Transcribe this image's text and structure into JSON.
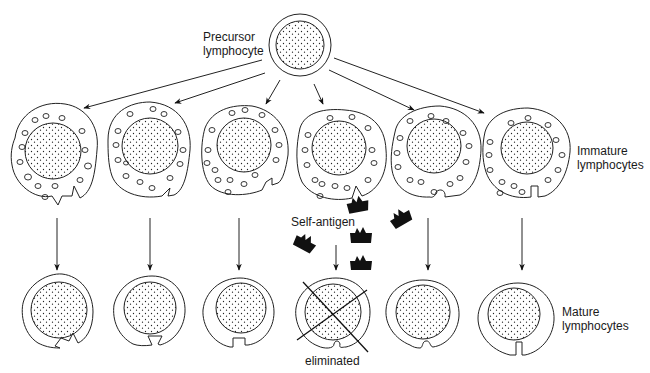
{
  "labels": {
    "precursor": [
      "Precursor",
      "lymphocyte"
    ],
    "immature": [
      "Immature",
      "lymphocytes"
    ],
    "mature": [
      "Mature",
      "lymphocytes"
    ],
    "self_antigen": "Self-antigen",
    "eliminated": "eliminated"
  },
  "precursor": {
    "cx": 300,
    "cy": 45,
    "outer_r": 31,
    "inner_r": 24
  },
  "immature_cells": [
    {
      "cx": 52,
      "cy": 157,
      "receptor": "zigzag"
    },
    {
      "cx": 147,
      "cy": 152,
      "receptor": "triangle"
    },
    {
      "cx": 244,
      "cy": 155,
      "receptor": "step"
    },
    {
      "cx": 340,
      "cy": 158,
      "receptor": "v-notch",
      "binds_self_antigen": true
    },
    {
      "cx": 437,
      "cy": 155,
      "receptor": "round"
    },
    {
      "cx": 532,
      "cy": 155,
      "receptor": "slot"
    }
  ],
  "mature_cells": [
    {
      "cx": 57,
      "cy": 318,
      "receptor": "zigzag"
    },
    {
      "cx": 150,
      "cy": 316,
      "receptor": "triangle"
    },
    {
      "cx": 239,
      "cy": 316,
      "receptor": "step"
    },
    {
      "cx": 336,
      "cy": 318,
      "receptor": "v-notch",
      "eliminated": true
    },
    {
      "cx": 425,
      "cy": 318,
      "receptor": "round"
    },
    {
      "cx": 520,
      "cy": 317,
      "receptor": "slot"
    }
  ],
  "self_antigens": [
    {
      "x": 358,
      "y": 205,
      "rot": -10
    },
    {
      "x": 400,
      "y": 218,
      "rot": -30
    },
    {
      "x": 305,
      "y": 243,
      "rot": 25
    },
    {
      "x": 360,
      "y": 237,
      "rot": 0
    },
    {
      "x": 360,
      "y": 266,
      "rot": 0
    }
  ]
}
